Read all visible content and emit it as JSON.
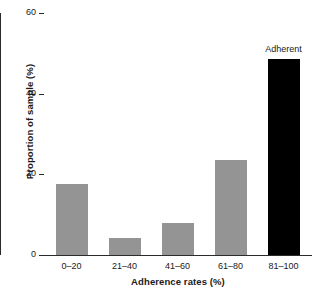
{
  "chart_data": {
    "type": "bar",
    "title": "",
    "categories": [
      "0–20",
      "21–40",
      "41–60",
      "61–80",
      "81–100"
    ],
    "values": [
      17.5,
      4.2,
      8.0,
      23.5,
      48.5
    ],
    "series": [
      {
        "name": "Proportion of sample",
        "values": [
          17.5,
          4.2,
          8.0,
          23.5,
          48.5
        ]
      }
    ],
    "xlabel": "Adherence rates (%)",
    "ylabel": "Proportion of sample (%)",
    "ylim": [
      0,
      60
    ],
    "yticks": [
      0,
      20,
      40,
      60
    ],
    "ytick_labels": [
      "0",
      "20",
      "40",
      "60"
    ],
    "grid": false,
    "legend": false,
    "bar_colors": [
      "#949494",
      "#949494",
      "#949494",
      "#949494",
      "#000000"
    ],
    "annotations": [
      {
        "text": "Adherent",
        "category": "81–100",
        "value": 48.5
      }
    ],
    "colors": {
      "bar_grey": "#949494",
      "bar_black": "#000000",
      "axis": "#2b2b2b",
      "text": "#1a1a1a",
      "background": "#ffffff"
    }
  }
}
